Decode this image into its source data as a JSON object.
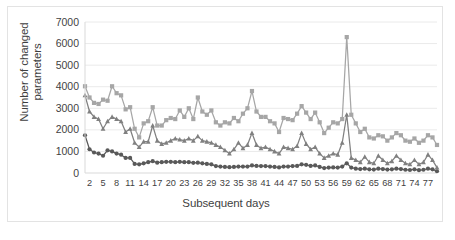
{
  "chart_data": {
    "type": "line",
    "title": "",
    "xlabel": "Subsequent days",
    "ylabel": "Number of changed parameters",
    "ylim": [
      0,
      7000
    ],
    "ytick_labels": [
      "0",
      "1000",
      "2000",
      "3000",
      "4000",
      "5000",
      "6000",
      "7000"
    ],
    "ytick_values": [
      0,
      1000,
      2000,
      3000,
      4000,
      5000,
      6000,
      7000
    ],
    "xtick_labels": [
      "2",
      "5",
      "8",
      "11",
      "14",
      "17",
      "20",
      "23",
      "26",
      "29",
      "32",
      "35",
      "38",
      "41",
      "44",
      "47",
      "50",
      "53",
      "56",
      "59",
      "62",
      "65",
      "68",
      "71",
      "74",
      "77"
    ],
    "xtick_values": [
      2,
      5,
      8,
      11,
      14,
      17,
      20,
      23,
      26,
      29,
      32,
      35,
      38,
      41,
      44,
      47,
      50,
      53,
      56,
      59,
      62,
      65,
      68,
      71,
      74,
      77
    ],
    "xlim": [
      1,
      79
    ],
    "grid": "horizontal",
    "legend": "none",
    "x": [
      1,
      2,
      3,
      4,
      5,
      6,
      7,
      8,
      9,
      10,
      11,
      12,
      13,
      14,
      15,
      16,
      17,
      18,
      19,
      20,
      21,
      22,
      23,
      24,
      25,
      26,
      27,
      28,
      29,
      30,
      31,
      32,
      33,
      34,
      35,
      36,
      37,
      38,
      39,
      40,
      41,
      42,
      43,
      44,
      45,
      46,
      47,
      48,
      49,
      50,
      51,
      52,
      53,
      54,
      55,
      56,
      57,
      58,
      59,
      60,
      61,
      62,
      63,
      64,
      65,
      66,
      67,
      68,
      69,
      70,
      71,
      72,
      73,
      74,
      75,
      76,
      77,
      78,
      79
    ],
    "series": [
      {
        "name": "series-upper",
        "color": "#a6a6a6",
        "marker": "square",
        "values": [
          4020,
          3500,
          3250,
          3200,
          3400,
          3350,
          4020,
          3700,
          3600,
          2950,
          3050,
          2050,
          1650,
          2300,
          2400,
          3050,
          2200,
          2200,
          2450,
          2550,
          2500,
          2900,
          2600,
          3000,
          2500,
          3500,
          2850,
          2700,
          2900,
          2350,
          2200,
          2350,
          2300,
          2550,
          2400,
          2750,
          3000,
          3800,
          2850,
          2600,
          2600,
          2400,
          2300,
          1900,
          2550,
          2500,
          2450,
          2750,
          3100,
          2800,
          2500,
          2800,
          2350,
          1850,
          2100,
          2350,
          2300,
          2500,
          6300,
          2700,
          2300,
          1900,
          2050,
          1650,
          1600,
          1750,
          1700,
          1500,
          1650,
          1850,
          1750,
          1500,
          1450,
          1600,
          1400,
          1500,
          1750,
          1650,
          1300
        ]
      },
      {
        "name": "series-middle",
        "color": "#808080",
        "marker": "triangle",
        "values": [
          3600,
          2850,
          2600,
          2500,
          2050,
          2400,
          2600,
          2500,
          2400,
          1900,
          2050,
          1400,
          1200,
          1450,
          1450,
          2200,
          1500,
          1350,
          1400,
          1500,
          1600,
          1550,
          1500,
          1600,
          1500,
          1700,
          1500,
          1450,
          1400,
          1300,
          1200,
          1050,
          900,
          1100,
          1400,
          1150,
          1300,
          1850,
          1300,
          1150,
          1200,
          1100,
          1000,
          900,
          1200,
          1150,
          1100,
          1250,
          1850,
          1350,
          1100,
          1200,
          900,
          700,
          800,
          900,
          850,
          1400,
          2700,
          700,
          600,
          500,
          750,
          500,
          450,
          800,
          600,
          450,
          550,
          800,
          600,
          450,
          400,
          600,
          400,
          500,
          850,
          600,
          250
        ]
      },
      {
        "name": "series-lower",
        "color": "#595959",
        "marker": "circle",
        "values": [
          1750,
          1100,
          950,
          900,
          800,
          1050,
          1000,
          900,
          850,
          700,
          700,
          420,
          400,
          450,
          500,
          550,
          480,
          500,
          520,
          520,
          500,
          520,
          500,
          500,
          470,
          480,
          450,
          420,
          400,
          320,
          300,
          280,
          270,
          280,
          300,
          300,
          300,
          350,
          330,
          320,
          320,
          300,
          280,
          260,
          300,
          300,
          320,
          330,
          400,
          380,
          330,
          350,
          280,
          230,
          250,
          260,
          250,
          300,
          450,
          250,
          200,
          180,
          200,
          170,
          160,
          200,
          180,
          160,
          170,
          200,
          180,
          150,
          140,
          170,
          130,
          150,
          200,
          170,
          80
        ]
      }
    ]
  }
}
